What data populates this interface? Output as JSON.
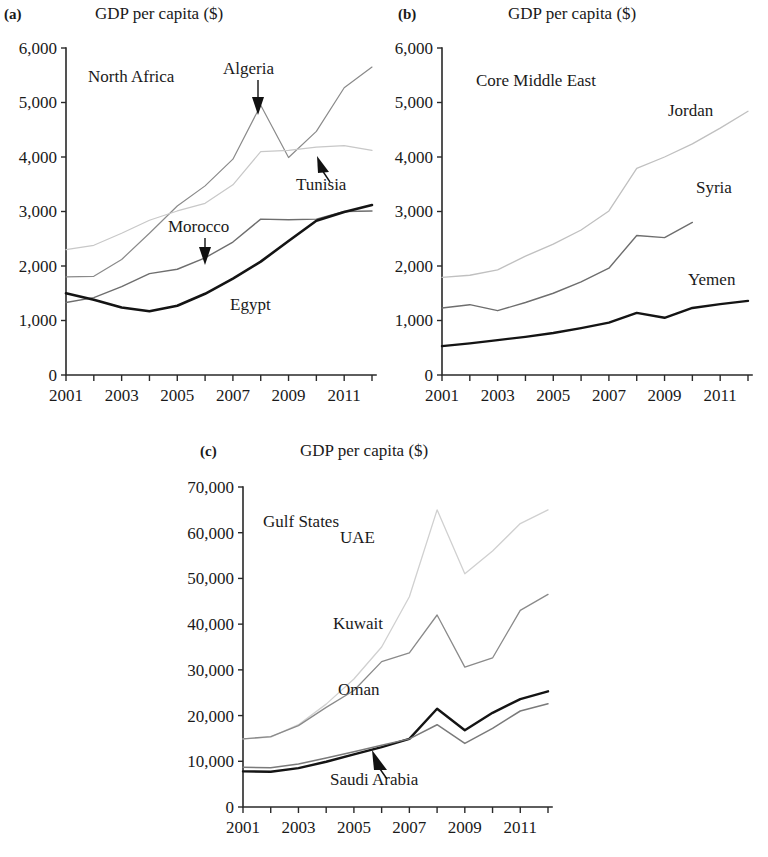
{
  "figure": {
    "axis_title": "GDP per capita ($)",
    "panels": [
      {
        "tag": "(a)",
        "region": "North Africa",
        "title": "GDP per capita ($)",
        "ylim": [
          0,
          6000
        ],
        "yticks": [
          "0",
          "1,000",
          "2,000",
          "3,000",
          "4,000",
          "5,000",
          "6,000"
        ],
        "xticks": [
          "2001",
          "2003",
          "2005",
          "2007",
          "2009",
          "2011"
        ],
        "series_labels": [
          "Algeria",
          "Tunisia",
          "Morocco",
          "Egypt"
        ]
      },
      {
        "tag": "(b)",
        "region": "Core Middle East",
        "title": "GDP per capita ($)",
        "ylim": [
          0,
          6000
        ],
        "yticks": [
          "0",
          "1,000",
          "2,000",
          "3,000",
          "4,000",
          "5,000",
          "6,000"
        ],
        "xticks": [
          "2001",
          "2003",
          "2005",
          "2007",
          "2009",
          "2011"
        ],
        "series_labels": [
          "Jordan",
          "Syria",
          "Yemen"
        ]
      },
      {
        "tag": "(c)",
        "region": "Gulf States",
        "title": "GDP per capita ($)",
        "ylim": [
          0,
          70000
        ],
        "yticks": [
          "0",
          "10,000",
          "20,000",
          "30,000",
          "40,000",
          "50,000",
          "60,000",
          "70,000"
        ],
        "xticks": [
          "2001",
          "2003",
          "2005",
          "2007",
          "2009",
          "2011"
        ],
        "series_labels": [
          "UAE",
          "Kuwait",
          "Oman",
          "Saudi Arabia"
        ]
      }
    ]
  },
  "chart_data": [
    {
      "type": "line",
      "title": "GDP per capita ($)",
      "subtitle": "North Africa",
      "panel": "(a)",
      "xlabel": "",
      "ylabel": "GDP per capita ($)",
      "x": [
        2001,
        2002,
        2003,
        2004,
        2005,
        2006,
        2007,
        2008,
        2009,
        2010,
        2011,
        2012
      ],
      "xlim": [
        2001,
        2012
      ],
      "ylim": [
        0,
        6000
      ],
      "yticks": [
        0,
        1000,
        2000,
        3000,
        4000,
        5000,
        6000
      ],
      "xticks": [
        2001,
        2002,
        2003,
        2004,
        2005,
        2006,
        2007,
        2008,
        2009,
        2010,
        2011,
        2012
      ],
      "grid": false,
      "legend": "inline-annotations",
      "series": [
        {
          "name": "Algeria",
          "color": "#8a8a8a",
          "width": 1.2,
          "values": [
            1800,
            1810,
            2120,
            2600,
            3100,
            3470,
            3960,
            4950,
            3990,
            4470,
            5270,
            5650
          ]
        },
        {
          "name": "Tunisia",
          "color": "#c8c8c8",
          "width": 1.2,
          "values": [
            2300,
            2380,
            2600,
            2840,
            3010,
            3150,
            3490,
            4100,
            4120,
            4180,
            4210,
            4120
          ]
        },
        {
          "name": "Morocco",
          "color": "#6e6e6e",
          "width": 1.4,
          "values": [
            1330,
            1420,
            1620,
            1860,
            1940,
            2150,
            2440,
            2860,
            2850,
            2860,
            3000,
            3010
          ]
        },
        {
          "name": "Egypt",
          "color": "#141414",
          "width": 2.6,
          "values": [
            1500,
            1380,
            1240,
            1170,
            1270,
            1490,
            1770,
            2080,
            2460,
            2830,
            2990,
            3120
          ]
        }
      ]
    },
    {
      "type": "line",
      "title": "GDP per capita ($)",
      "subtitle": "Core Middle East",
      "panel": "(b)",
      "xlabel": "",
      "ylabel": "GDP per capita ($)",
      "x": [
        2001,
        2002,
        2003,
        2004,
        2005,
        2006,
        2007,
        2008,
        2009,
        2010,
        2011,
        2012
      ],
      "xlim": [
        2001,
        2012
      ],
      "ylim": [
        0,
        6000
      ],
      "yticks": [
        0,
        1000,
        2000,
        3000,
        4000,
        5000,
        6000
      ],
      "xticks": [
        2001,
        2002,
        2003,
        2004,
        2005,
        2006,
        2007,
        2008,
        2009,
        2010,
        2011,
        2012
      ],
      "grid": false,
      "legend": "inline-annotations",
      "series": [
        {
          "name": "Jordan",
          "color": "#c0c0c0",
          "width": 1.3,
          "values": [
            1790,
            1830,
            1930,
            2180,
            2400,
            2660,
            3010,
            3790,
            4000,
            4240,
            4530,
            4840
          ]
        },
        {
          "name": "Syria",
          "color": "#6e6e6e",
          "width": 1.4,
          "values": [
            1230,
            1290,
            1180,
            1330,
            1500,
            1710,
            1960,
            2560,
            2520,
            2800,
            null,
            null
          ]
        },
        {
          "name": "Yemen",
          "color": "#141414",
          "width": 2.4,
          "values": [
            530,
            580,
            640,
            700,
            770,
            860,
            960,
            1140,
            1050,
            1230,
            1300,
            1360
          ]
        }
      ]
    },
    {
      "type": "line",
      "title": "GDP per capita ($)",
      "subtitle": "Gulf States",
      "panel": "(c)",
      "xlabel": "",
      "ylabel": "GDP per capita ($)",
      "x": [
        2001,
        2002,
        2003,
        2004,
        2005,
        2006,
        2007,
        2008,
        2009,
        2010,
        2011,
        2012
      ],
      "xlim": [
        2001,
        2012
      ],
      "ylim": [
        0,
        70000
      ],
      "yticks": [
        0,
        10000,
        20000,
        30000,
        40000,
        50000,
        60000,
        70000
      ],
      "xticks": [
        2001,
        2002,
        2003,
        2004,
        2005,
        2006,
        2007,
        2008,
        2009,
        2010,
        2011,
        2012
      ],
      "grid": false,
      "legend": "inline-annotations",
      "series": [
        {
          "name": "UAE",
          "color": "#d0d0d0",
          "width": 1.3,
          "values": [
            14900,
            15300,
            18000,
            22500,
            28000,
            35000,
            46000,
            65000,
            51000,
            56000,
            62000,
            65000
          ]
        },
        {
          "name": "Kuwait",
          "color": "#8a8a8a",
          "width": 1.3,
          "values": [
            14900,
            15400,
            17800,
            21800,
            25500,
            31800,
            33700,
            42000,
            30600,
            32600,
            43000,
            46500
          ]
        },
        {
          "name": "Oman",
          "color": "#141414",
          "width": 2.4,
          "values": [
            7800,
            7700,
            8500,
            9900,
            11500,
            13100,
            14900,
            21500,
            16800,
            20600,
            23600,
            25300
          ]
        },
        {
          "name": "Saudi Arabia",
          "color": "#7a7a7a",
          "width": 1.5,
          "values": [
            8700,
            8600,
            9400,
            10700,
            12100,
            13500,
            14900,
            18000,
            13900,
            17200,
            21000,
            22600
          ]
        }
      ]
    }
  ]
}
